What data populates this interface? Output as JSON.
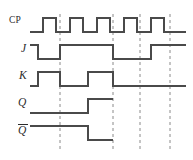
{
  "diagram": {
    "kind": "digital-timing-diagram",
    "width": 193,
    "height": 160,
    "background_color": "#ffffff",
    "trace_color": "#4a4a4a",
    "guide_color": "#8a8a8a",
    "label_color": "#2b2b2b",
    "trace_width": 1.6,
    "guide_width": 1.0,
    "guide_dash": "3,3"
  },
  "axes": {
    "x_start": 30,
    "x_end": 186,
    "guide_lines_x": [
      60,
      113,
      140,
      170
    ],
    "guide_top": 14,
    "guide_bottom": 152
  },
  "labels": [
    {
      "id": "cp",
      "text": "CP",
      "style": "roman",
      "x": 9,
      "y": 16,
      "overbar": false
    },
    {
      "id": "j",
      "text": "J",
      "style": "ital",
      "x": 21,
      "y": 43,
      "overbar": false
    },
    {
      "id": "k",
      "text": "K",
      "style": "ital",
      "x": 19,
      "y": 70,
      "overbar": false
    },
    {
      "id": "q",
      "text": "Q",
      "style": "ital",
      "x": 18,
      "y": 97,
      "overbar": false
    },
    {
      "id": "qbar",
      "text": "Q",
      "style": "ital",
      "x": 18,
      "y": 124,
      "overbar": true
    }
  ],
  "chart_data": {
    "type": "line",
    "xlabel": "",
    "ylabel": "",
    "signals": [
      {
        "name": "CP",
        "row_high_y": 18,
        "row_low_y": 32,
        "x_start": 30,
        "x_end": 186,
        "initial_level": 0,
        "transitions_x": [
          43,
          56,
          70,
          83,
          97,
          110,
          124,
          137,
          151,
          164
        ],
        "levels": [
          0,
          1,
          0,
          1,
          0,
          1,
          0,
          1,
          0,
          1,
          0
        ],
        "terminates_at": 186
      },
      {
        "name": "J",
        "row_high_y": 45,
        "row_low_y": 59,
        "x_start": 30,
        "x_end": 186,
        "initial_level": 1,
        "transitions_x": [
          38,
          60,
          113,
          151
        ],
        "levels": [
          1,
          0,
          1,
          0,
          1
        ],
        "terminates_at": 186
      },
      {
        "name": "K",
        "row_high_y": 72,
        "row_low_y": 86,
        "x_start": 30,
        "x_end": 186,
        "initial_level": 0,
        "transitions_x": [
          38,
          60,
          88,
          113
        ],
        "levels": [
          0,
          1,
          0,
          1,
          0
        ],
        "terminates_at": 186
      },
      {
        "name": "Q",
        "row_high_y": 99,
        "row_low_y": 113,
        "x_start": 30,
        "x_end": 113,
        "initial_level": 0,
        "transitions_x": [
          88
        ],
        "levels": [
          0,
          1
        ],
        "terminates_at": 113
      },
      {
        "name": "Qbar",
        "row_high_y": 126,
        "row_low_y": 140,
        "x_start": 30,
        "x_end": 113,
        "initial_level": 1,
        "transitions_x": [
          88
        ],
        "levels": [
          1,
          0
        ],
        "terminates_at": 113
      }
    ]
  }
}
